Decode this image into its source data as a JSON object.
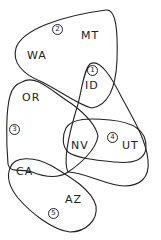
{
  "diagram": {
    "type": "hand-drawn set/grouping diagram",
    "states": [
      {
        "id": "WA",
        "label": "WA"
      },
      {
        "id": "MT",
        "label": "MT"
      },
      {
        "id": "ID",
        "label": "ID"
      },
      {
        "id": "OR",
        "label": "OR"
      },
      {
        "id": "NV",
        "label": "NV"
      },
      {
        "id": "UT",
        "label": "UT"
      },
      {
        "id": "CA",
        "label": "CA"
      },
      {
        "id": "AZ",
        "label": "AZ"
      }
    ],
    "groups": [
      {
        "number": "1",
        "members": [
          "ID",
          "NV",
          "UT"
        ]
      },
      {
        "number": "2",
        "members": [
          "WA",
          "MT",
          "ID"
        ]
      },
      {
        "number": "3",
        "members": [
          "OR",
          "NV",
          "CA"
        ]
      },
      {
        "number": "4",
        "members": [
          "NV",
          "UT"
        ]
      },
      {
        "number": "5",
        "members": [
          "CA",
          "AZ"
        ]
      }
    ],
    "stroke_color": "#222222",
    "background": "#ffffff"
  }
}
